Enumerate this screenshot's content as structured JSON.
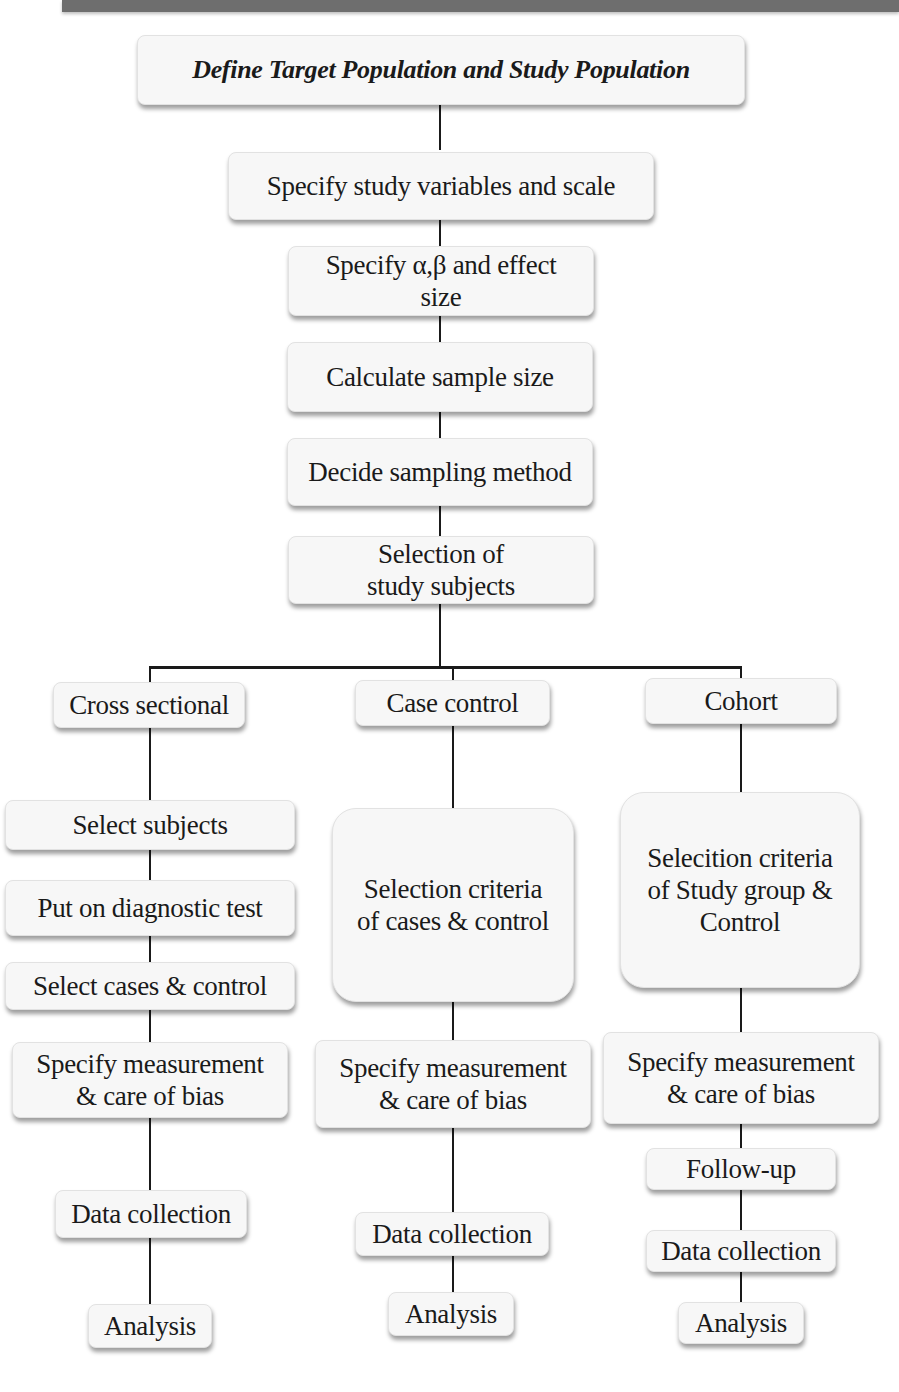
{
  "diagram": {
    "main_flow": [
      {
        "id": "define_population",
        "label": "Define Target Population and  Study Population"
      },
      {
        "id": "study_variables",
        "label": "Specify study variables and scale"
      },
      {
        "id": "alpha_beta",
        "label": "Specify α,β and effect\nsize"
      },
      {
        "id": "sample_size",
        "label": "Calculate sample size"
      },
      {
        "id": "sampling_method",
        "label": "Decide sampling  method"
      },
      {
        "id": "selection_subjects",
        "label": "Selection of\nstudy subjects"
      }
    ],
    "branches": [
      {
        "name": "Cross sectional",
        "steps": [
          "Select subjects",
          "Put on diagnostic test",
          "Select cases & control",
          "Specify measurement\n& care of bias",
          "Data  collection",
          "Analysis"
        ]
      },
      {
        "name": "Case control",
        "steps": [
          "Selection criteria\nof cases & control",
          "Specify measurement\n& care of bias",
          "Data collection",
          "Analysis"
        ]
      },
      {
        "name": "Cohort",
        "steps": [
          "Selecition criteria\nof  Study group  &\nControl",
          "Specify measurement\n& care of bias",
          "Follow-up",
          "Data collection",
          "Analysis"
        ]
      }
    ]
  },
  "colors": {
    "box_fill": "#f7f7f7",
    "line": "#1a1a1a",
    "top_bar": "#6e6e6e"
  }
}
